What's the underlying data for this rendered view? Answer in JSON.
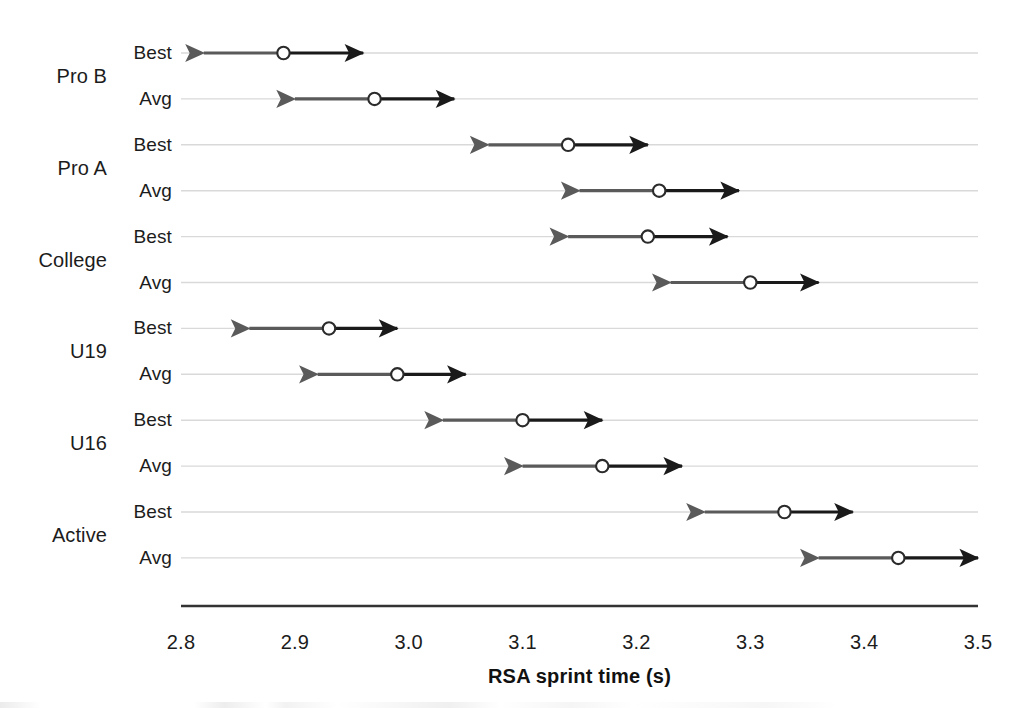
{
  "chart_data": {
    "type": "scatter",
    "title": "",
    "xlabel": "RSA sprint time (s)",
    "ylabel": "",
    "xlim": [
      2.8,
      3.5
    ],
    "xticks": [
      "2.8",
      "2.9",
      "3.0",
      "3.1",
      "3.2",
      "3.3",
      "3.4",
      "3.5"
    ],
    "xtick_values": [
      2.8,
      2.9,
      3.0,
      3.1,
      3.2,
      3.3,
      3.4,
      3.5
    ],
    "grid": true,
    "legend": "none",
    "groups": [
      "Pro B",
      "Pro A",
      "College",
      "U19",
      "U16",
      "Active"
    ],
    "row_labels": [
      "Best",
      "Avg"
    ],
    "colors": {
      "left_arrow": "#5a5a5a",
      "right_arrow": "#1a1a1a",
      "marker_fill": "#ffffff",
      "marker_stroke": "#2b2b2b",
      "gridline": "#d9d9d9",
      "axis": "#333333",
      "text": "#1c1c1c"
    },
    "series": [
      {
        "group": "Pro B",
        "row": "Best",
        "value": 2.89,
        "left": 2.82,
        "right": 2.96
      },
      {
        "group": "Pro B",
        "row": "Avg",
        "value": 2.97,
        "left": 2.9,
        "right": 3.04
      },
      {
        "group": "Pro A",
        "row": "Best",
        "value": 3.14,
        "left": 3.07,
        "right": 3.21
      },
      {
        "group": "Pro A",
        "row": "Avg",
        "value": 3.22,
        "left": 3.15,
        "right": 3.29
      },
      {
        "group": "College",
        "row": "Best",
        "value": 3.21,
        "left": 3.14,
        "right": 3.28
      },
      {
        "group": "College",
        "row": "Avg",
        "value": 3.3,
        "left": 3.23,
        "right": 3.36
      },
      {
        "group": "U19",
        "row": "Best",
        "value": 2.93,
        "left": 2.86,
        "right": 2.99
      },
      {
        "group": "U19",
        "row": "Avg",
        "value": 2.99,
        "left": 2.92,
        "right": 3.05
      },
      {
        "group": "U16",
        "row": "Best",
        "value": 3.1,
        "left": 3.03,
        "right": 3.17
      },
      {
        "group": "U16",
        "row": "Avg",
        "value": 3.17,
        "left": 3.1,
        "right": 3.24
      },
      {
        "group": "Active",
        "row": "Best",
        "value": 3.33,
        "left": 3.26,
        "right": 3.39
      },
      {
        "group": "Active",
        "row": "Avg",
        "value": 3.43,
        "left": 3.36,
        "right": 3.5
      }
    ]
  },
  "axis": {
    "title": "RSA sprint time (s)",
    "ticks": [
      "2.8",
      "2.9",
      "3.0",
      "3.1",
      "3.2",
      "3.3",
      "3.4",
      "3.5"
    ]
  },
  "groups": [
    {
      "label": "Pro B"
    },
    {
      "label": "Pro A"
    },
    {
      "label": "College"
    },
    {
      "label": "U19"
    },
    {
      "label": "U16"
    },
    {
      "label": "Active"
    }
  ],
  "rows": [
    {
      "group": "Pro B",
      "label": "Best"
    },
    {
      "group": "Pro B",
      "label": "Avg"
    },
    {
      "group": "Pro A",
      "label": "Best"
    },
    {
      "group": "Pro A",
      "label": "Avg"
    },
    {
      "group": "College",
      "label": "Best"
    },
    {
      "group": "College",
      "label": "Avg"
    },
    {
      "group": "U19",
      "label": "Best"
    },
    {
      "group": "U19",
      "label": "Avg"
    },
    {
      "group": "U16",
      "label": "Best"
    },
    {
      "group": "U16",
      "label": "Avg"
    },
    {
      "group": "Active",
      "label": "Best"
    },
    {
      "group": "Active",
      "label": "Avg"
    }
  ],
  "layout": {
    "plot_left_px": 181,
    "plot_right_px": 978,
    "row_start_y_px": 53,
    "row_step_px": 45.9,
    "axis_y_px": 606,
    "tick_label_y_px": 631,
    "axis_title_y_px": 665,
    "row_label_right_px": 172,
    "group_label_right_px": 107
  }
}
